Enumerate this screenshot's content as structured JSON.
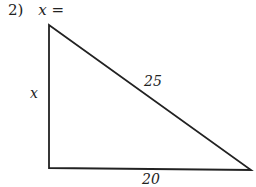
{
  "problem": {
    "number": "2)",
    "prompt": "x ="
  },
  "triangle": {
    "type": "right triangle",
    "vertices": {
      "top": [
        49,
        25
      ],
      "bottom_left": [
        49,
        168
      ],
      "bottom_right": [
        251,
        170
      ]
    },
    "labels": {
      "vertical_leg": "x",
      "hypotenuse": "25",
      "horizontal_leg": "20"
    },
    "stroke_color": "#222222"
  }
}
